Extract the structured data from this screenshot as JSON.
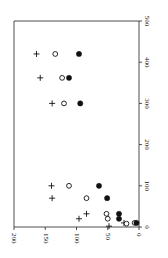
{
  "chart_data": {
    "type": "scatter",
    "title": "",
    "xlabel": "",
    "ylabel": "",
    "orientation_note": "figure is rotated 90 degrees clockwise",
    "x_axis": {
      "range": [
        0,
        500
      ],
      "ticks": [
        "0",
        "100",
        "200",
        "300",
        "400",
        "500"
      ]
    },
    "y_axis": {
      "range": [
        0,
        200
      ],
      "ticks": [
        "0",
        "50",
        "100",
        "150",
        "200"
      ]
    },
    "grid": false,
    "legend": null,
    "series": [
      {
        "name": "plus",
        "marker": "+",
        "points": [
          [
            2,
            48
          ],
          [
            10,
            24
          ],
          [
            20,
            96
          ],
          [
            32,
            84
          ],
          [
            70,
            139
          ],
          [
            100,
            140
          ],
          [
            300,
            139
          ],
          [
            362,
            158
          ],
          [
            420,
            164
          ]
        ]
      },
      {
        "name": "open-circle",
        "marker": "o",
        "points": [
          [
            8,
            20
          ],
          [
            10,
            7
          ],
          [
            20,
            50
          ],
          [
            32,
            52
          ],
          [
            70,
            84
          ],
          [
            100,
            112
          ],
          [
            300,
            120
          ],
          [
            362,
            123
          ],
          [
            420,
            134
          ]
        ]
      },
      {
        "name": "filled-circle",
        "marker": "filled",
        "points": [
          [
            10,
            4
          ],
          [
            20,
            32
          ],
          [
            32,
            32
          ],
          [
            70,
            51
          ],
          [
            100,
            64
          ],
          [
            300,
            94
          ],
          [
            362,
            112
          ],
          [
            420,
            96
          ]
        ]
      }
    ]
  }
}
